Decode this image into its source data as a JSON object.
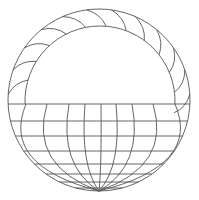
{
  "figure": {
    "stroke_color": "#555555",
    "background_color": "#ffffff",
    "ring_spoke_count": 12,
    "grid_meridian_count": 9,
    "grid_parallel_count": 8
  }
}
